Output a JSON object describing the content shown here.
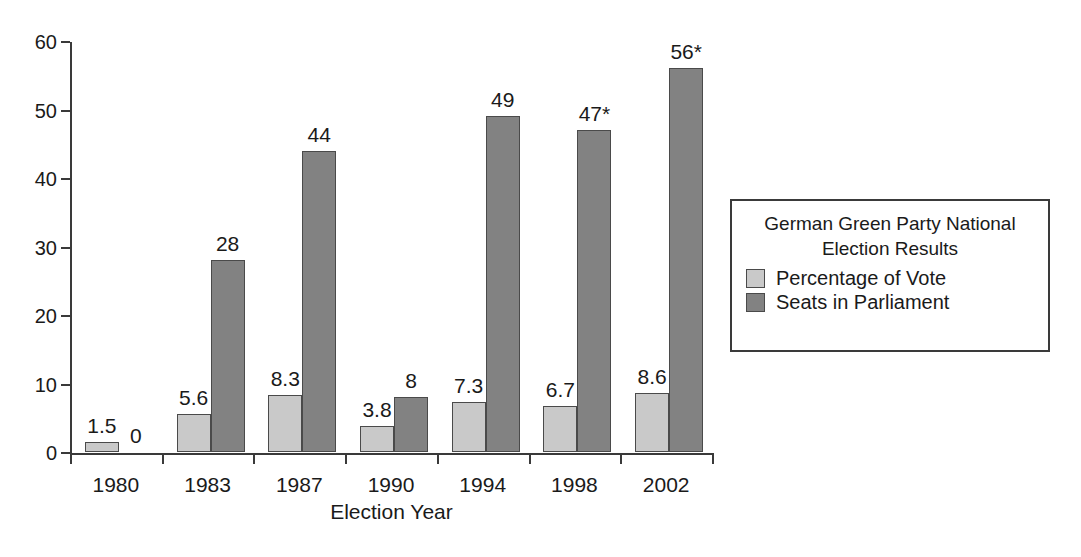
{
  "chart_data": {
    "type": "bar",
    "title": "German Green Party National Election Results",
    "xlabel": "Election Year",
    "ylabel": "",
    "categories": [
      "1980",
      "1983",
      "1987",
      "1990",
      "1994",
      "1998",
      "2002"
    ],
    "series": [
      {
        "name": "Percentage of Vote",
        "color": "#c9c9c9",
        "values": [
          1.5,
          5.6,
          8.3,
          3.8,
          7.3,
          6.7,
          8.6
        ],
        "labels": [
          "1.5",
          "5.6",
          "8.3",
          "3.8",
          "7.3",
          "6.7",
          "8.6"
        ]
      },
      {
        "name": "Seats in Parliament",
        "color": "#828282",
        "values": [
          0,
          28,
          44,
          8,
          49,
          47,
          56
        ],
        "labels": [
          "0",
          "28",
          "44",
          "8",
          "49",
          "47*",
          "56*"
        ]
      }
    ],
    "ylim": [
      0,
      60
    ],
    "yticks": [
      0,
      10,
      20,
      30,
      40,
      50,
      60
    ],
    "ytick_labels": [
      "0",
      "10",
      "20",
      "30",
      "40",
      "50",
      "60"
    ],
    "grid": false,
    "legend_position": "right"
  },
  "axis": {
    "x_title": "Election Year"
  },
  "legend": {
    "title_line1": "German Green Party National",
    "title_line2": "Election Results",
    "entries": [
      {
        "label": "Percentage of Vote",
        "swatch": "vote"
      },
      {
        "label": "Seats in Parliament",
        "swatch": "seats"
      }
    ]
  }
}
